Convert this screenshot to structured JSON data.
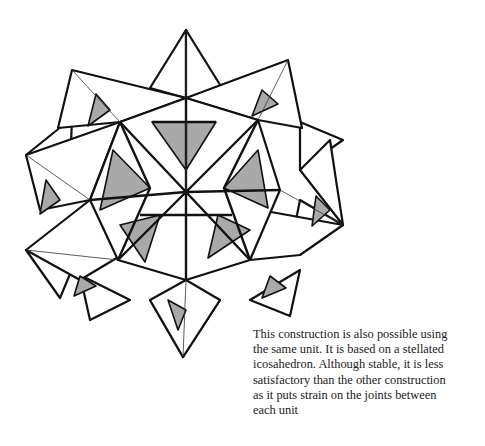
{
  "figure": {
    "colors": {
      "line": "#111111",
      "paper": "#ffffff",
      "shade": "#a9a9a9"
    }
  },
  "caption": {
    "lines": [
      "This construction is also possible using",
      "the same unit. It is based on a stellated",
      "icosahedron. Although stable, it is less",
      "satisfactory than the other construction",
      "as it puts strain on the joints between",
      "each unit"
    ]
  }
}
